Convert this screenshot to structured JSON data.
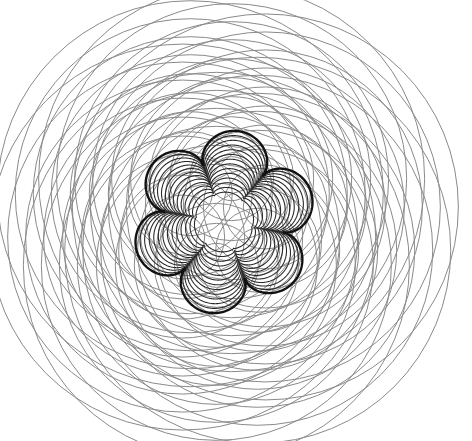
{
  "figure": {
    "title": "Six families of concentric circles forming a six-lobed flower curve"
  },
  "canvas": {
    "width": 472,
    "height": 441,
    "background": "#ffffff"
  },
  "construction": {
    "center": [
      224,
      222
    ],
    "families": {
      "count": 6,
      "center_ring_radius": 44,
      "start_angle_deg": 40,
      "radii": [
        22,
        42,
        62,
        82,
        101,
        120,
        139,
        157,
        175,
        193
      ],
      "stroke_color": "#8a8a8a"
    },
    "flower": {
      "lobes": 6,
      "notch_angle_deg": 10,
      "outer_tip_radius": 92,
      "outer_notch_radius": 60,
      "inner_contour_count": 13,
      "innermost_tip_radius": 30,
      "innermost_notch_radius": 28,
      "outline_color": "#111111",
      "contour_color": "#2a2a2a"
    }
  }
}
